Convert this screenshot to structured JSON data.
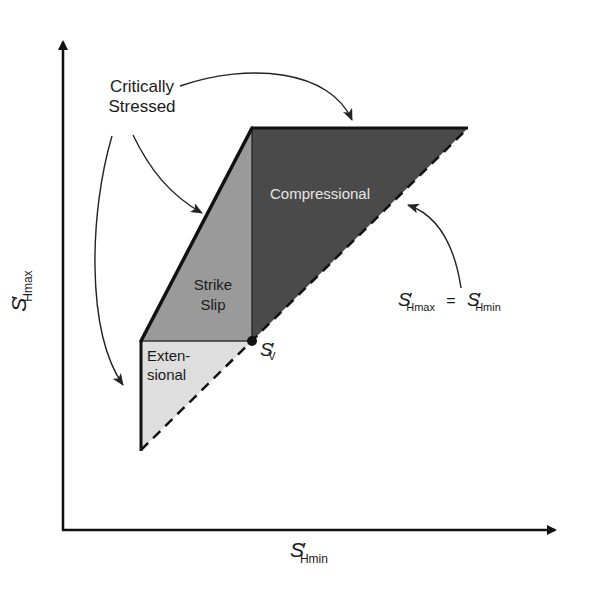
{
  "diagram": {
    "title": "",
    "regions": [
      {
        "id": "extensional",
        "label_line1": "Exten-",
        "label_line2": "sional",
        "fill": "#dedede"
      },
      {
        "id": "strike_slip",
        "label_line1": "Strike",
        "label_line2": "Slip",
        "fill": "#9a9a9a"
      },
      {
        "id": "compressional",
        "label": "Compressional",
        "fill": "#4a4a4a",
        "text_color": "#e6e6e6"
      }
    ],
    "annotations": {
      "critically_stressed_line1": "Critically",
      "critically_stressed_line2": "Stressed",
      "sv_point": {
        "base": "S",
        "prime": "′",
        "sub": "V"
      },
      "equality_line": {
        "lhs_base": "S",
        "lhs_sub": "Hmax",
        "eq": "=",
        "rhs_base": "S",
        "rhs_sub": "Hmin",
        "prime": "′"
      }
    },
    "axes": {
      "x_label": {
        "base": "S",
        "prime": "′",
        "sub": "Hmin"
      },
      "y_label": {
        "base": "S",
        "prime": "′",
        "sub": "Hmax"
      }
    },
    "colors": {
      "line": "#111111",
      "arrow": "#222222"
    }
  }
}
